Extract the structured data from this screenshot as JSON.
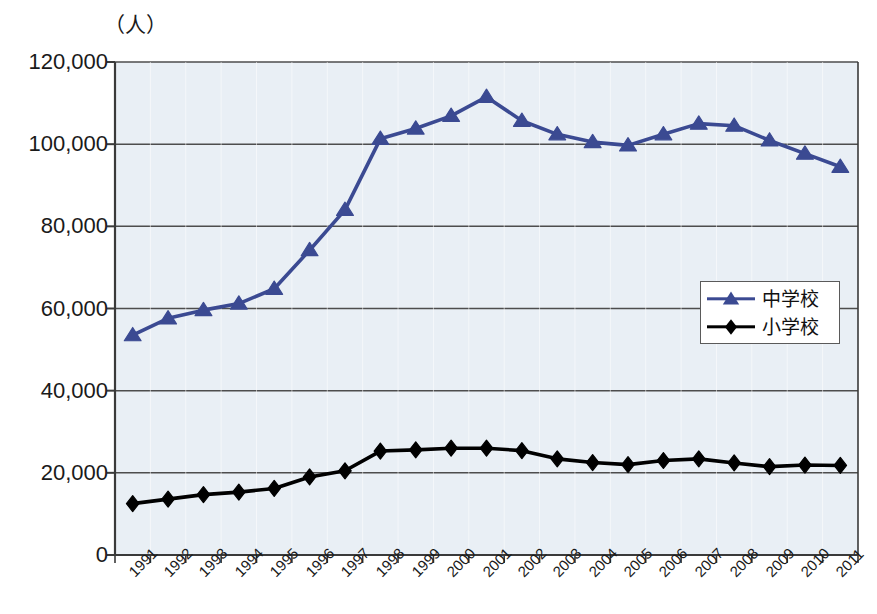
{
  "chart_data": {
    "type": "line",
    "title": "",
    "xlabel": "",
    "ylabel": "（人）",
    "unit_label": "（人）",
    "categories": [
      "1991",
      "1992",
      "1993",
      "1994",
      "1995",
      "1996",
      "1997",
      "1998",
      "1999",
      "2000",
      "2001",
      "2002",
      "2003",
      "2004",
      "2005",
      "2006",
      "2007",
      "2008",
      "2009",
      "2010",
      "2011"
    ],
    "ylim": [
      0,
      120000
    ],
    "ytick_values": [
      0,
      20000,
      40000,
      60000,
      80000,
      100000,
      120000
    ],
    "ytick_labels": [
      "0",
      "20,000",
      "40,000",
      "60,000",
      "80,000",
      "100,000",
      "120,000"
    ],
    "grid": true,
    "grid_axis": "y",
    "legend_position": "center-right",
    "series": [
      {
        "name": "中学校",
        "color": "#3b4a92",
        "marker": "triangle",
        "values": [
          53500,
          57600,
          59600,
          61200,
          64800,
          74200,
          84000,
          101300,
          103800,
          106900,
          111500,
          105700,
          102400,
          100500,
          99700,
          102400,
          105000,
          104500,
          100900,
          97700,
          94500
        ]
      },
      {
        "name": "小学校",
        "color": "#000000",
        "marker": "diamond",
        "values": [
          12500,
          13600,
          14700,
          15300,
          16200,
          19000,
          20500,
          25300,
          25600,
          26000,
          26000,
          25400,
          23400,
          22500,
          22000,
          23000,
          23400,
          22400,
          21500,
          21900,
          21800
        ]
      }
    ]
  },
  "caption": {
    "text": ""
  },
  "colors": {
    "plot_background": "#e9eff5",
    "gridline": "#4d4d4d",
    "axis": "#3a3a3a",
    "series_blue": "#3b4a92",
    "series_black": "#000000",
    "legend_border": "#5a5a5a"
  },
  "legend": {
    "items": [
      {
        "label": "中学校",
        "color": "#3b4a92",
        "marker": "triangle"
      },
      {
        "label": "小学校",
        "color": "#000000",
        "marker": "diamond"
      }
    ]
  }
}
